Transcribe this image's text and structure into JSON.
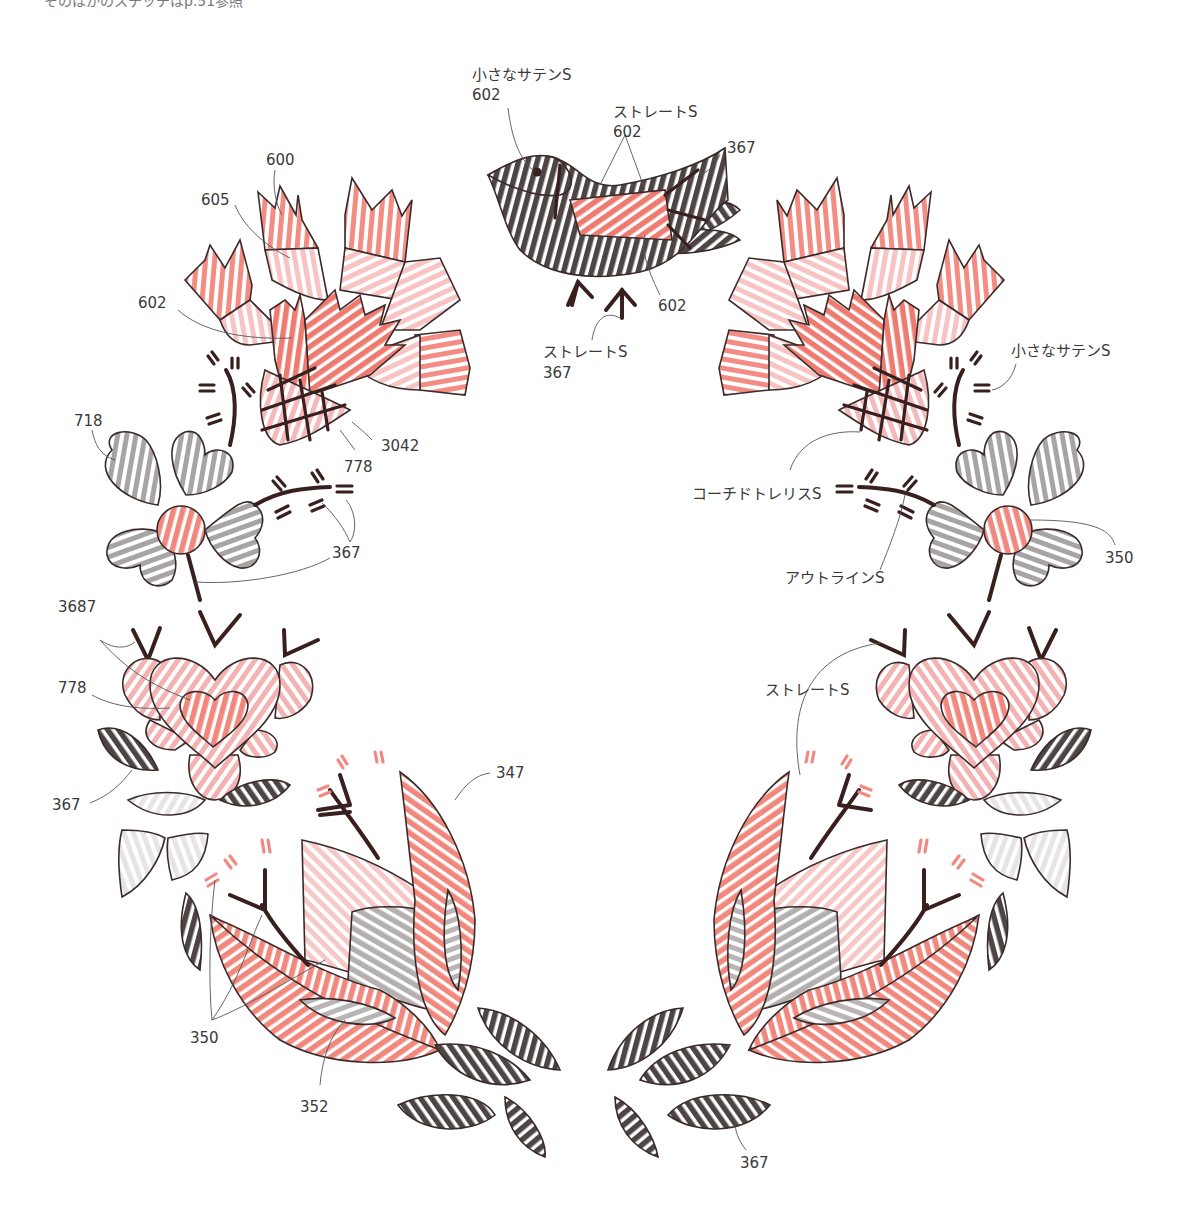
{
  "page": {
    "top_note": "そのほかのステッチはp.51参照"
  },
  "colors": {
    "thread_600": "#f07d72",
    "thread_605": "#f7c3c3",
    "thread_602": "#ee7b70",
    "thread_3042": "#f4b9b9",
    "thread_778": "#f4aeae",
    "thread_718": "#a7a4a4",
    "thread_367": "#4d4444",
    "thread_350": "#f0887d",
    "thread_347": "#ee7d72",
    "thread_352": "#b9b5b5",
    "thread_3687": "#f4b3b3",
    "outline": "#3a2a2a",
    "dark_stitch": "#3a1f1f",
    "pink_stitch": "#f08a80",
    "leader_line": "#555555"
  },
  "labels": {
    "bird_small_satin": "小さなサテンS",
    "bird_small_satin_num": "602",
    "bird_straight": "ストレートS",
    "bird_straight_num": "602",
    "bird_wing_num": "367",
    "bird_body_num": "602",
    "bird_feet_straight": "ストレートS",
    "bird_feet_num": "367",
    "tl_600": "600",
    "tl_605": "605",
    "tl_602": "602",
    "tl_3042": "3042",
    "tl_778": "778",
    "ml_718": "718",
    "ml_367": "367",
    "ll_3687": "3687",
    "ll_778": "778",
    "ll_367": "367",
    "bl_347": "347",
    "bl_350": "350",
    "bl_352": "352",
    "br_367": "367",
    "tr_small_satin": "小さなサテンS",
    "tr_coached_trellis": "コーチドトレリスS",
    "tr_outline": "アウトラインS",
    "tr_350": "350",
    "rr_straight": "ストレートS"
  }
}
